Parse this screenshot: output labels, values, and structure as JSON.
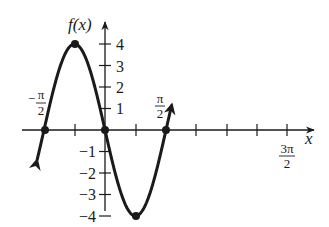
{
  "chart_data": {
    "type": "line",
    "title": "",
    "function": "f(x) = -4 sin(2x)",
    "xlabel": "x",
    "ylabel": "f(x)",
    "x_range": [
      "-π/2 - ε",
      "3π/2 + ε"
    ],
    "y_range": [
      -4,
      4
    ],
    "x_ticks": [
      "-π/2",
      "-π/4",
      "0",
      "π/4",
      "π/2",
      "3π/4",
      "π",
      "5π/4",
      "3π/2"
    ],
    "x_tick_labels": [
      {
        "value": "-π/2",
        "numerator": "π",
        "denominator": "2",
        "sign": "−"
      },
      {
        "value": "π/2",
        "numerator": "π",
        "denominator": "2",
        "sign": ""
      },
      {
        "value": "3π/2",
        "numerator": "3π",
        "denominator": "2",
        "sign": ""
      }
    ],
    "y_ticks": [
      -4,
      -3,
      -2,
      -1,
      1,
      2,
      3,
      4
    ],
    "y_tick_labels": [
      "−4",
      "−3",
      "−2",
      "−1",
      "1",
      "2",
      "3",
      "4"
    ],
    "marked_points": [
      {
        "x": "-π/2",
        "y": 0
      },
      {
        "x": "-π/4",
        "y": 4
      },
      {
        "x": "0",
        "y": 0
      },
      {
        "x": "π/4",
        "y": -4
      },
      {
        "x": "π/2",
        "y": 0
      }
    ],
    "curve_domain_approx": [
      -1.75,
      1.72
    ],
    "grid": false,
    "legend": null
  },
  "labels": {
    "x_axis": "x",
    "y_axis": "f(x)",
    "neg_pi_half": {
      "sign": "−",
      "num": "π",
      "den": "2"
    },
    "pi_half": {
      "num": "π",
      "den": "2"
    },
    "three_pi_half": {
      "num": "3π",
      "den": "2"
    },
    "y_tick_labels": [
      "4",
      "3",
      "2",
      "1",
      "−1",
      "−2",
      "−3",
      "−4"
    ]
  },
  "colors": {
    "ink": "#1a1a1a",
    "background": "#ffffff"
  }
}
